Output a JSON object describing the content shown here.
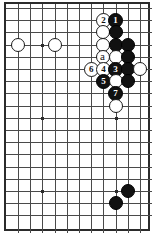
{
  "figure": {
    "type": "go-board-diagram",
    "title": "",
    "board": {
      "columns": 11,
      "rows": 18,
      "origin_x": 16,
      "origin_y": 6,
      "spacing": 12.2,
      "line_color": "#4a4a4a",
      "border_color": "#2b2b2b",
      "background_color": "#ffffff"
    },
    "star_points": [
      {
        "col": 2,
        "row": 3
      },
      {
        "col": 2,
        "row": 9
      },
      {
        "col": 2,
        "row": 15
      },
      {
        "col": 8,
        "row": 9
      },
      {
        "col": 8,
        "row": 15
      }
    ],
    "stones": [
      {
        "col": 0,
        "row": 3,
        "color": "white",
        "label": ""
      },
      {
        "col": 3,
        "row": 3,
        "color": "white",
        "label": ""
      },
      {
        "col": 7,
        "row": 1,
        "color": "white",
        "label": "2"
      },
      {
        "col": 8,
        "row": 1,
        "color": "black",
        "label": "1"
      },
      {
        "col": 7,
        "row": 2,
        "color": "white",
        "label": ""
      },
      {
        "col": 8,
        "row": 2,
        "color": "black",
        "label": ""
      },
      {
        "col": 7,
        "row": 3,
        "color": "white",
        "label": ""
      },
      {
        "col": 8,
        "row": 3,
        "color": "black",
        "label": ""
      },
      {
        "col": 9,
        "row": 3,
        "color": "black",
        "label": ""
      },
      {
        "col": 7,
        "row": 4,
        "color": "white",
        "label": ""
      },
      {
        "col": 8,
        "row": 4,
        "color": "white",
        "label": ""
      },
      {
        "col": 9,
        "row": 4,
        "color": "black",
        "label": ""
      },
      {
        "col": 6,
        "row": 5,
        "color": "white",
        "label": "6"
      },
      {
        "col": 7,
        "row": 5,
        "color": "white",
        "label": "4"
      },
      {
        "col": 8,
        "row": 5,
        "color": "black",
        "label": "3"
      },
      {
        "col": 9,
        "row": 5,
        "color": "black",
        "label": ""
      },
      {
        "col": 10,
        "row": 5,
        "color": "white",
        "label": ""
      },
      {
        "col": 7,
        "row": 6,
        "color": "black",
        "label": "5"
      },
      {
        "col": 8,
        "row": 6,
        "color": "white",
        "label": ""
      },
      {
        "col": 9,
        "row": 6,
        "color": "black",
        "label": ""
      },
      {
        "col": 8,
        "row": 7,
        "color": "black",
        "label": "7"
      },
      {
        "col": 8,
        "row": 8,
        "color": "white",
        "label": ""
      },
      {
        "col": 8,
        "row": 16,
        "color": "black",
        "label": ""
      },
      {
        "col": 9,
        "row": 15,
        "color": "black",
        "label": ""
      }
    ],
    "point_labels": [
      {
        "col": 7,
        "row": 4,
        "text": "a"
      }
    ],
    "move_sequence": [
      {
        "number": "1",
        "color": "black"
      },
      {
        "number": "2",
        "color": "white"
      },
      {
        "number": "3",
        "color": "black"
      },
      {
        "number": "4",
        "color": "white"
      },
      {
        "number": "5",
        "color": "black"
      },
      {
        "number": "6",
        "color": "white"
      },
      {
        "number": "7",
        "color": "black"
      }
    ]
  }
}
